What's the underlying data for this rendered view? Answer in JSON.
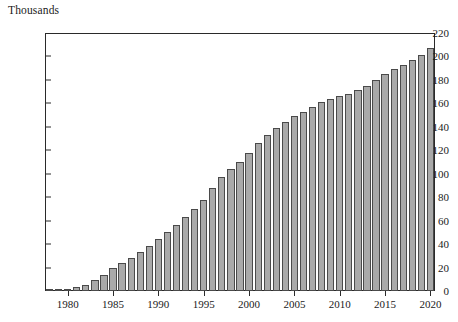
{
  "chart_data": {
    "type": "bar",
    "title": "Thousands",
    "xlabel": "",
    "ylabel": "Thousands",
    "ylim": [
      0,
      220
    ],
    "ytick_step": 20,
    "yticks": [
      0,
      20,
      40,
      60,
      80,
      100,
      120,
      140,
      160,
      180,
      200,
      220
    ],
    "ytick_labels": [
      "0",
      "20",
      "40",
      "60",
      "80",
      "100",
      "120",
      "140",
      "160",
      "180",
      "200",
      "220"
    ],
    "xticks": [
      1980,
      1985,
      1990,
      1995,
      2000,
      2005,
      2010,
      2015,
      2020
    ],
    "xtick_labels": [
      "1980",
      "1985",
      "1990",
      "1995",
      "2000",
      "2005",
      "2010",
      "2015",
      "2020"
    ],
    "grid": false,
    "legend": false,
    "bar_color": "#a9a9a9",
    "bar_edge_color": "#4a4a4a",
    "axis_color": "#2a2a2a",
    "background_color": "#ffffff",
    "categories": [
      1978,
      1979,
      1980,
      1981,
      1982,
      1983,
      1984,
      1985,
      1986,
      1987,
      1988,
      1989,
      1990,
      1991,
      1992,
      1993,
      1994,
      1995,
      1996,
      1997,
      1998,
      1999,
      2000,
      2001,
      2002,
      2003,
      2004,
      2005,
      2006,
      2007,
      2008,
      2009,
      2010,
      2011,
      2012,
      2013,
      2014,
      2015,
      2016,
      2017,
      2018,
      2019,
      2020
    ],
    "values": [
      1,
      1,
      2,
      3,
      5,
      9,
      14,
      20,
      24,
      28,
      33,
      38,
      44,
      50,
      56,
      63,
      70,
      78,
      88,
      97,
      104,
      110,
      118,
      126,
      133,
      139,
      144,
      149,
      153,
      157,
      161,
      164,
      166,
      168,
      171,
      175,
      180,
      185,
      189,
      193,
      197,
      201,
      207
    ]
  }
}
